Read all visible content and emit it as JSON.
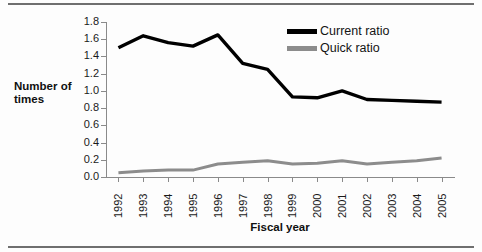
{
  "figure": {
    "y_axis_title": "Number of times",
    "x_axis_title": "Fiscal year"
  },
  "legend": {
    "position": "top-right",
    "entries": [
      {
        "label": "Current ratio",
        "color": "#000000",
        "swatch_name": "current-ratio-swatch"
      },
      {
        "label": "Quick ratio",
        "color": "#8c8c8c",
        "swatch_name": "quick-ratio-swatch"
      }
    ]
  },
  "y_ticks": [
    "0.0",
    "0.2",
    "0.4",
    "0.6",
    "0.8",
    "1.0",
    "1.2",
    "1.4",
    "1.6",
    "1.8"
  ],
  "x_ticks": [
    "1992",
    "1993",
    "1994",
    "1995",
    "1996",
    "1997",
    "1998",
    "1999",
    "2000",
    "2001",
    "2002",
    "2003",
    "2004",
    "2005"
  ],
  "chart_data": {
    "type": "line",
    "title": "",
    "subtitle": "",
    "xlabel": "Fiscal year",
    "ylabel": "Number of times",
    "categories": [
      "1992",
      "1993",
      "1994",
      "1995",
      "1996",
      "1997",
      "1998",
      "1999",
      "2000",
      "2001",
      "2002",
      "2003",
      "2004",
      "2005"
    ],
    "x": [
      1992,
      1993,
      1994,
      1995,
      1996,
      1997,
      1998,
      1999,
      2000,
      2001,
      2002,
      2003,
      2004,
      2005
    ],
    "series": [
      {
        "name": "Current ratio",
        "color": "#000000",
        "values": [
          1.5,
          1.64,
          1.56,
          1.52,
          1.65,
          1.32,
          1.25,
          0.93,
          0.92,
          1.0,
          0.9,
          0.89,
          0.88,
          0.87
        ]
      },
      {
        "name": "Quick ratio",
        "color": "#8c8c8c",
        "values": [
          0.05,
          0.07,
          0.08,
          0.08,
          0.15,
          0.17,
          0.19,
          0.15,
          0.16,
          0.19,
          0.15,
          0.17,
          0.19,
          0.22
        ]
      }
    ],
    "ylim": [
      0.0,
      1.8
    ],
    "ytick_step": 0.2,
    "grid": false,
    "legend_position": "top-right"
  }
}
